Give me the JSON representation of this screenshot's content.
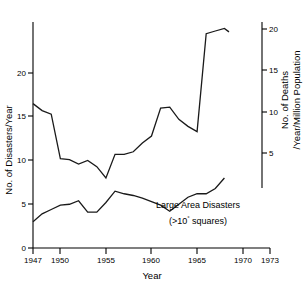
{
  "chart_data": {
    "type": "line",
    "title": "",
    "xlabel": "Year",
    "ylabel": "No. of Disasters/Year",
    "y2label_line1": "No. of Deaths",
    "y2label_line2": "/Year/Million Population",
    "xlim": [
      1947,
      1973
    ],
    "ylim": [
      0,
      25.7
    ],
    "y2lim": [
      3.8,
      21.4
    ],
    "grid": false,
    "legend": "none",
    "xticks": [
      1947,
      1950,
      1955,
      1960,
      1965,
      1970,
      1973
    ],
    "xticklabels": [
      "1947",
      "1950",
      "1955",
      "1960",
      "1965",
      "1970",
      "1973"
    ],
    "yticks": [
      0,
      5,
      10,
      15,
      20
    ],
    "yticklabels": [
      "0",
      "5",
      "10",
      "15",
      "20"
    ],
    "y2ticks": [
      5,
      10,
      15,
      20
    ],
    "y2ticklabels": [
      "5",
      "10",
      "15",
      "20"
    ],
    "x": [
      1947,
      1948,
      1949,
      1950,
      1951,
      1952,
      1953,
      1954,
      1955,
      1956,
      1957,
      1958,
      1959,
      1960,
      1961,
      1962,
      1963,
      1964,
      1965,
      1966,
      1967,
      1968
    ],
    "series": [
      {
        "name": "No. of Disasters/Year",
        "axis": "left",
        "values": [
          16.5,
          15.7,
          15.3,
          10.2,
          10.1,
          9.6,
          10.0,
          9.3,
          8.0,
          10.7,
          10.7,
          11.0,
          12.0,
          12.8,
          16.0,
          16.1,
          14.7,
          13.9,
          13.3,
          24.5,
          24.8,
          25.1
        ]
      },
      {
        "name": "Large Area Disasters",
        "axis": "left",
        "values": [
          3.0,
          3.9,
          4.4,
          4.9,
          5.0,
          5.4,
          4.1,
          4.1,
          5.2,
          6.5,
          6.2,
          6.0,
          5.7,
          5.3,
          4.9,
          4.2,
          5.0,
          5.8,
          6.2,
          6.2,
          6.8,
          8.0
        ]
      }
    ],
    "series_end_x": 1968.5,
    "series_end_value": 24.7,
    "annotations": [
      {
        "name": "large-area-disasters-label",
        "line1": "Large Area Disasters",
        "line2_pre": "(>10",
        "line2_sup": "°",
        "line2_post": " squares)"
      }
    ]
  }
}
